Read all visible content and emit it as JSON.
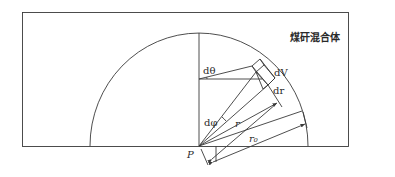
{
  "diagram": {
    "region_label": "煤矸混合体",
    "labels": {
      "d_theta": "dθ",
      "d_V": "dV",
      "d_r": "dr",
      "d_phi": "dφ",
      "r": "r",
      "r0": "r₀",
      "point": "P"
    },
    "colors": {
      "stroke": "#3a3a3a",
      "background": "#ffffff"
    }
  }
}
